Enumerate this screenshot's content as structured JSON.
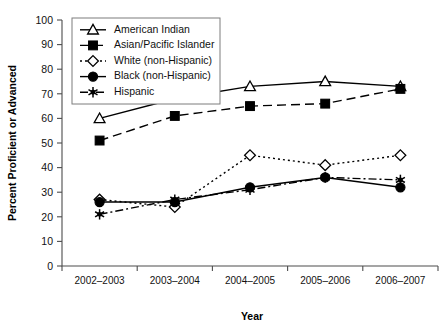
{
  "chart_data": {
    "type": "line",
    "title": "",
    "xlabel": "Year",
    "ylabel": "Percent Proficient or Advanced",
    "categories": [
      "2002–2003",
      "2003–2004",
      "2004–2005",
      "2005–2006",
      "2006–2007"
    ],
    "ylim": [
      0,
      100
    ],
    "y_ticks": [
      "0",
      "10",
      "20",
      "30",
      "40",
      "50",
      "60",
      "70",
      "80",
      "90",
      "100"
    ],
    "grid": false,
    "legend_position": "top-left-inside",
    "series": [
      {
        "name": "American Indian",
        "marker": "open-triangle",
        "line_style": "solid",
        "values": [
          60,
          68,
          73,
          75,
          73
        ]
      },
      {
        "name": "Asian/Pacific Islander",
        "marker": "solid-square",
        "line_style": "dashed",
        "values": [
          51,
          61,
          65,
          66,
          72
        ]
      },
      {
        "name": "White (non-Hispanic)",
        "marker": "open-diamond",
        "line_style": "dotted",
        "values": [
          27,
          24,
          45,
          41,
          45
        ]
      },
      {
        "name": "Black (non-Hispanic)",
        "marker": "solid-circle",
        "line_style": "solid",
        "values": [
          26,
          26,
          32,
          36,
          32
        ]
      },
      {
        "name": "Hispanic",
        "marker": "star",
        "line_style": "dash-dot",
        "values": [
          21,
          27,
          31,
          36,
          35
        ]
      }
    ]
  }
}
